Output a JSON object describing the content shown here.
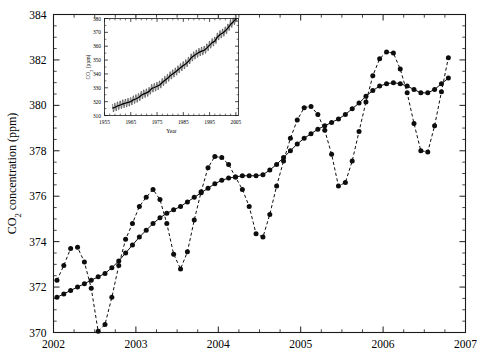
{
  "figure": {
    "name": "keeling-curve-co2",
    "background": "#ffffff",
    "ink": "#000000"
  },
  "chart_data": {
    "type": "line",
    "title": "",
    "xlabel": "",
    "ylabel": "CO<sub>2</sub> concentration (ppm)",
    "ylabel_plain": "CO2 concentration (ppm)",
    "ylabel_prefix": "CO",
    "ylabel_sub": "2",
    "ylabel_suffix": " concentration (ppm)",
    "xlim": [
      2002.0,
      2007.0
    ],
    "ylim": [
      370,
      384
    ],
    "xticks": [
      2002,
      2003,
      2004,
      2005,
      2006,
      2007
    ],
    "xticklabels": [
      "2002",
      "2003",
      "2004",
      "2005",
      "2006",
      "2007"
    ],
    "yticks": [
      370,
      372,
      374,
      376,
      378,
      380,
      382,
      384
    ],
    "yticklabels": [
      "370",
      "372",
      "374",
      "376",
      "378",
      "380",
      "382",
      "384"
    ],
    "grid": false,
    "legend": null,
    "minor_ticks": true,
    "series": [
      {
        "name": "monthly-mean-co2",
        "style": "dashed-with-markers",
        "marker": "filled-circle",
        "x": [
          2002.042,
          2002.125,
          2002.208,
          2002.292,
          2002.375,
          2002.458,
          2002.542,
          2002.625,
          2002.708,
          2002.792,
          2002.875,
          2002.958,
          2003.042,
          2003.125,
          2003.208,
          2003.292,
          2003.375,
          2003.458,
          2003.542,
          2003.625,
          2003.708,
          2003.792,
          2003.875,
          2003.958,
          2004.042,
          2004.125,
          2004.208,
          2004.292,
          2004.375,
          2004.458,
          2004.542,
          2004.625,
          2004.708,
          2004.792,
          2004.875,
          2004.958,
          2005.042,
          2005.125,
          2005.208,
          2005.292,
          2005.375,
          2005.458,
          2005.542,
          2005.625,
          2005.708,
          2005.792,
          2005.875,
          2005.958,
          2006.042,
          2006.125,
          2006.208,
          2006.292,
          2006.375,
          2006.458,
          2006.542,
          2006.625,
          2006.708,
          2006.792
        ],
        "y": [
          372.3,
          372.95,
          373.7,
          373.75,
          373.1,
          371.95,
          370.05,
          370.35,
          371.55,
          372.95,
          374.1,
          374.8,
          375.55,
          375.95,
          376.3,
          375.85,
          374.8,
          373.45,
          372.8,
          373.55,
          374.95,
          376.2,
          377.25,
          377.75,
          377.7,
          377.4,
          376.85,
          376.3,
          375.55,
          374.35,
          374.2,
          375.2,
          376.45,
          377.55,
          378.55,
          379.35,
          379.9,
          379.95,
          379.6,
          378.9,
          377.85,
          376.45,
          376.6,
          377.55,
          378.85,
          380.15,
          381.3,
          382.05,
          382.35,
          382.3,
          381.6,
          380.55,
          379.2,
          378.0,
          377.95,
          379.1,
          380.6,
          382.1
        ],
        "approx_count": 58
      },
      {
        "name": "smoothed-trend-co2",
        "style": "solid-with-markers",
        "marker": "filled-circle",
        "x": [
          2002.042,
          2002.125,
          2002.208,
          2002.292,
          2002.375,
          2002.458,
          2002.542,
          2002.625,
          2002.708,
          2002.792,
          2002.875,
          2002.958,
          2003.042,
          2003.125,
          2003.208,
          2003.292,
          2003.375,
          2003.458,
          2003.542,
          2003.625,
          2003.708,
          2003.792,
          2003.875,
          2003.958,
          2004.042,
          2004.125,
          2004.208,
          2004.292,
          2004.375,
          2004.458,
          2004.542,
          2004.625,
          2004.708,
          2004.792,
          2004.875,
          2004.958,
          2005.042,
          2005.125,
          2005.208,
          2005.292,
          2005.375,
          2005.458,
          2005.542,
          2005.625,
          2005.708,
          2005.792,
          2005.875,
          2005.958,
          2006.042,
          2006.125,
          2006.208,
          2006.292,
          2006.375,
          2006.458,
          2006.542,
          2006.625,
          2006.708,
          2006.792
        ],
        "y": [
          371.55,
          371.7,
          371.85,
          372.0,
          372.15,
          372.3,
          372.45,
          372.6,
          372.85,
          373.15,
          373.5,
          373.85,
          374.2,
          374.5,
          374.8,
          375.05,
          375.25,
          375.4,
          375.55,
          375.75,
          375.95,
          376.15,
          376.35,
          376.55,
          376.7,
          376.8,
          376.85,
          376.9,
          376.9,
          376.9,
          376.95,
          377.15,
          377.4,
          377.7,
          378.0,
          378.3,
          378.55,
          378.75,
          378.95,
          379.1,
          379.25,
          379.4,
          379.6,
          379.85,
          380.1,
          380.4,
          380.65,
          380.85,
          380.95,
          381.0,
          380.95,
          380.85,
          380.7,
          380.55,
          380.55,
          380.7,
          380.95,
          381.2
        ],
        "approx_count": 58
      }
    ]
  },
  "inset": {
    "name": "full-record-inset",
    "type": "line",
    "title": "",
    "xlabel": "Year",
    "ylabel_prefix": "CO",
    "ylabel_sub": "2",
    "ylabel_suffix": " (ppm)",
    "ylabel_plain": "CO2 (ppm)",
    "xlim": [
      1955,
      2006
    ],
    "ylim": [
      310,
      380
    ],
    "xticks": [
      1955,
      1965,
      1975,
      1985,
      1995,
      2005
    ],
    "xticklabels": [
      "1955",
      "1965",
      "1975",
      "1985",
      "1995",
      "2005"
    ],
    "yticks": [
      310,
      320,
      330,
      340,
      350,
      360,
      370,
      380
    ],
    "yticklabels": [
      "310",
      "320",
      "330",
      "340",
      "350",
      "360",
      "370",
      "380"
    ],
    "grid": false,
    "series_name": "mauna-loa-monthly-co2",
    "description": "monthly CO2 with seasonal sawtooth oscillation rising from ~315 ppm in 1958 to ~379 ppm in 2005",
    "annual_means": [
      {
        "year": 1958,
        "value": 315.3
      },
      {
        "year": 1959,
        "value": 315.9
      },
      {
        "year": 1960,
        "value": 316.9
      },
      {
        "year": 1961,
        "value": 317.6
      },
      {
        "year": 1962,
        "value": 318.4
      },
      {
        "year": 1963,
        "value": 318.9
      },
      {
        "year": 1964,
        "value": 319.5
      },
      {
        "year": 1965,
        "value": 320.0
      },
      {
        "year": 1966,
        "value": 321.3
      },
      {
        "year": 1967,
        "value": 322.1
      },
      {
        "year": 1968,
        "value": 323.0
      },
      {
        "year": 1969,
        "value": 324.6
      },
      {
        "year": 1970,
        "value": 325.6
      },
      {
        "year": 1971,
        "value": 326.3
      },
      {
        "year": 1972,
        "value": 327.4
      },
      {
        "year": 1973,
        "value": 329.6
      },
      {
        "year": 1974,
        "value": 330.2
      },
      {
        "year": 1975,
        "value": 331.1
      },
      {
        "year": 1976,
        "value": 332.0
      },
      {
        "year": 1977,
        "value": 333.8
      },
      {
        "year": 1978,
        "value": 335.4
      },
      {
        "year": 1979,
        "value": 336.8
      },
      {
        "year": 1980,
        "value": 338.7
      },
      {
        "year": 1981,
        "value": 340.1
      },
      {
        "year": 1982,
        "value": 341.4
      },
      {
        "year": 1983,
        "value": 343.0
      },
      {
        "year": 1984,
        "value": 344.6
      },
      {
        "year": 1985,
        "value": 346.0
      },
      {
        "year": 1986,
        "value": 347.4
      },
      {
        "year": 1987,
        "value": 349.2
      },
      {
        "year": 1988,
        "value": 351.6
      },
      {
        "year": 1989,
        "value": 353.1
      },
      {
        "year": 1990,
        "value": 354.4
      },
      {
        "year": 1991,
        "value": 355.6
      },
      {
        "year": 1992,
        "value": 356.4
      },
      {
        "year": 1993,
        "value": 357.1
      },
      {
        "year": 1994,
        "value": 358.8
      },
      {
        "year": 1995,
        "value": 360.8
      },
      {
        "year": 1996,
        "value": 362.6
      },
      {
        "year": 1997,
        "value": 363.7
      },
      {
        "year": 1998,
        "value": 366.7
      },
      {
        "year": 1999,
        "value": 368.4
      },
      {
        "year": 2000,
        "value": 369.5
      },
      {
        "year": 2001,
        "value": 371.1
      },
      {
        "year": 2002,
        "value": 373.2
      },
      {
        "year": 2003,
        "value": 375.8
      },
      {
        "year": 2004,
        "value": 377.5
      },
      {
        "year": 2005,
        "value": 379.8
      }
    ],
    "seasonal_amplitude": 3.1
  }
}
